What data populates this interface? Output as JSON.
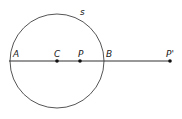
{
  "diagram": {
    "circle": {
      "label": "s",
      "cx": 57,
      "cy": 61,
      "r": 47,
      "stroke": "#555555"
    },
    "line": {
      "x1": 9,
      "y1": 61,
      "x2": 170,
      "y2": 61,
      "stroke": "#333333"
    },
    "points": [
      {
        "id": "A",
        "label": "A",
        "x": 9,
        "y": 61,
        "dot": false,
        "lx": 13,
        "ly": 57
      },
      {
        "id": "C",
        "label": "C",
        "x": 57,
        "y": 61,
        "dot": true,
        "lx": 54,
        "ly": 57
      },
      {
        "id": "P",
        "label": "P",
        "x": 80,
        "y": 61,
        "dot": true,
        "lx": 78,
        "ly": 57
      },
      {
        "id": "B",
        "label": "B",
        "x": 104,
        "y": 61,
        "dot": false,
        "lx": 106,
        "ly": 57
      },
      {
        "id": "P-prime",
        "label": "P'",
        "x": 170,
        "y": 61,
        "dot": true,
        "lx": 166,
        "ly": 57
      }
    ],
    "circle_label_pos": {
      "x": 80,
      "y": 15
    }
  }
}
